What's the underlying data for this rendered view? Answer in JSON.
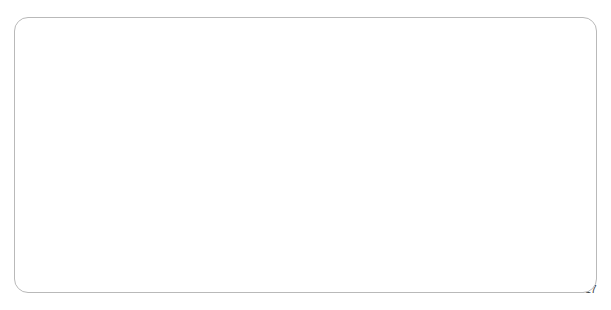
{
  "chart_data": {
    "type": "line",
    "title": "",
    "subtitle": "",
    "xlabel": "",
    "ylabel": "",
    "xlim": [
      2001,
      2017
    ],
    "ylim": [
      0,
      1.8
    ],
    "grid": true,
    "legend": "none",
    "line_color": "#808080",
    "gridline_color": "#a6a6a6",
    "axis_color": "#8a8a8a",
    "border_color": "#b9b9b9",
    "y_ticks": [
      "0",
      "0.2",
      "0.4",
      "0.6",
      "0.8",
      "1",
      "1.2",
      "1.4",
      "1.6",
      "1.8"
    ],
    "y_tick_values": [
      0,
      0.2,
      0.4,
      0.6,
      0.8,
      1.0,
      1.2,
      1.4,
      1.6,
      1.8
    ],
    "x_ticks": [
      "2001",
      "2002",
      "2003",
      "2004",
      "2005",
      "2006",
      "2007",
      "2008",
      "2009",
      "2010",
      "2011",
      "2012",
      "2013",
      "2014",
      "2015",
      "2016",
      "2017"
    ],
    "x_tick_values": [
      2001,
      2002,
      2003,
      2004,
      2005,
      2006,
      2007,
      2008,
      2009,
      2010,
      2011,
      2012,
      2013,
      2014,
      2015,
      2016,
      2017
    ],
    "series": [
      {
        "name": "series-1",
        "x": [
          2001.0,
          2001.08,
          2001.17,
          2001.25,
          2001.33,
          2001.42,
          2001.5,
          2001.58,
          2001.67,
          2001.75,
          2001.83,
          2001.92,
          2002.0,
          2002.08,
          2002.17,
          2002.25,
          2002.33,
          2002.42,
          2002.5,
          2002.58,
          2002.67,
          2002.75,
          2002.83,
          2002.92,
          2003.0,
          2003.08,
          2003.17,
          2003.25,
          2003.33,
          2003.42,
          2003.5,
          2003.58,
          2003.67,
          2003.75,
          2003.83,
          2003.92,
          2004.0,
          2004.08,
          2004.17,
          2004.25,
          2004.33,
          2004.42,
          2004.5,
          2004.58,
          2004.67,
          2004.75,
          2004.83,
          2004.92,
          2005.0,
          2005.08,
          2005.17,
          2005.25,
          2005.33,
          2005.42,
          2005.5,
          2005.58,
          2005.67,
          2005.75,
          2005.83,
          2005.92,
          2006.0,
          2006.08,
          2006.17,
          2006.25,
          2006.33,
          2006.42,
          2006.5,
          2006.58,
          2006.67,
          2006.75,
          2006.83,
          2006.92,
          2007.0,
          2007.08,
          2007.17,
          2007.25,
          2007.33,
          2007.42,
          2007.5,
          2007.58,
          2007.67,
          2007.75,
          2007.83,
          2007.92,
          2008.0,
          2008.08,
          2008.17,
          2008.25,
          2008.33,
          2008.42,
          2008.5,
          2008.58,
          2008.67,
          2008.75,
          2008.83,
          2008.92,
          2009.0,
          2009.08,
          2009.17,
          2009.25,
          2009.33,
          2009.42,
          2009.5,
          2009.58,
          2009.67,
          2009.75,
          2009.83,
          2009.92,
          2010.0,
          2010.08,
          2010.17,
          2010.25,
          2010.33,
          2010.42,
          2010.5,
          2010.58,
          2010.67,
          2010.75,
          2010.83,
          2010.92,
          2011.0,
          2011.08,
          2011.17,
          2011.25,
          2011.33,
          2011.42,
          2011.5,
          2011.58,
          2011.67,
          2011.75,
          2011.83,
          2011.92,
          2012.0,
          2012.08,
          2012.17,
          2012.25,
          2012.33,
          2012.42,
          2012.5,
          2012.58,
          2012.67,
          2012.75,
          2012.83,
          2012.92,
          2013.0,
          2013.08,
          2013.17,
          2013.25,
          2013.33,
          2013.42,
          2013.5,
          2013.58,
          2013.67,
          2013.75,
          2013.83,
          2013.92,
          2014.0,
          2014.08,
          2014.17,
          2014.25,
          2014.33,
          2014.42,
          2014.5,
          2014.58,
          2014.67,
          2014.75,
          2014.83,
          2014.92,
          2015.0,
          2015.08,
          2015.17,
          2015.25,
          2015.33,
          2015.42,
          2015.5,
          2015.58,
          2015.67,
          2015.75,
          2015.83,
          2015.92,
          2016.0,
          2016.08,
          2016.17,
          2016.25,
          2016.33,
          2016.42,
          2016.5,
          2016.58,
          2016.67,
          2016.75,
          2016.83,
          2016.92,
          2017.0
        ],
        "values": [
          0.935,
          0.93,
          0.92,
          0.912,
          0.905,
          0.893,
          0.882,
          0.87,
          0.862,
          0.875,
          0.893,
          0.905,
          0.912,
          0.9,
          0.888,
          0.882,
          0.878,
          0.878,
          0.88,
          0.882,
          0.89,
          0.92,
          0.96,
          0.985,
          0.988,
          0.98,
          0.985,
          1.005,
          1.02,
          1.018,
          1.018,
          1.02,
          1.038,
          1.07,
          1.095,
          1.098,
          1.085,
          1.075,
          1.085,
          1.11,
          1.135,
          1.16,
          1.172,
          1.168,
          1.16,
          1.168,
          1.18,
          1.178,
          1.165,
          1.145,
          1.12,
          1.105,
          1.1,
          1.112,
          1.118,
          1.11,
          1.1,
          1.095,
          1.098,
          1.11,
          1.125,
          1.14,
          1.152,
          1.16,
          1.162,
          1.172,
          1.18,
          1.178,
          1.175,
          1.182,
          1.192,
          1.2,
          1.21,
          1.218,
          1.225,
          1.24,
          1.258,
          1.272,
          1.28,
          1.29,
          1.3,
          1.315,
          1.34,
          1.37,
          1.4,
          1.43,
          1.47,
          1.52,
          1.56,
          1.585,
          1.56,
          1.575,
          1.572,
          1.42,
          1.3,
          1.27,
          1.255,
          1.3,
          1.258,
          1.29,
          1.335,
          1.38,
          1.42,
          1.45,
          1.48,
          1.498,
          1.495,
          1.47,
          1.445,
          1.42,
          1.392,
          1.36,
          1.325,
          1.272,
          1.252,
          1.265,
          1.29,
          1.33,
          1.372,
          1.35,
          1.34,
          1.37,
          1.4,
          1.428,
          1.45,
          1.462,
          1.445,
          1.452,
          1.452,
          1.42,
          1.388,
          1.362,
          1.34,
          1.322,
          1.3,
          1.282,
          1.262,
          1.27,
          1.285,
          1.3,
          1.318,
          1.33,
          1.325,
          1.318,
          1.325,
          1.335,
          1.345,
          1.34,
          1.338,
          1.35,
          1.362,
          1.368,
          1.365,
          1.372,
          1.378,
          1.38,
          1.382,
          1.378,
          1.372,
          1.365,
          1.35,
          1.33,
          1.3,
          1.265,
          1.215,
          1.17,
          1.132,
          1.105,
          1.078,
          1.062,
          1.075,
          1.095,
          1.1,
          1.09,
          1.082,
          1.075,
          1.09,
          1.098,
          1.09,
          1.078,
          1.072,
          1.082,
          1.098,
          1.112,
          1.108,
          1.098,
          1.095,
          1.102,
          1.11,
          1.105,
          1.092,
          1.078,
          1.062
        ]
      }
    ]
  }
}
